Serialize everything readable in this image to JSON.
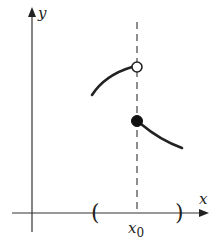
{
  "diagram": {
    "type": "piecewise function with jump discontinuity",
    "axes": {
      "x_label": "x",
      "y_label": "y"
    },
    "point_label": "x",
    "point_label_subscript": "0",
    "interval": {
      "left_bracket": "(",
      "right_bracket": ")"
    },
    "markers": [
      {
        "kind": "open-circle",
        "at": "x0",
        "position": "upper"
      },
      {
        "kind": "filled-circle",
        "at": "x0",
        "position": "lower"
      }
    ],
    "colors": {
      "stroke": "#222222",
      "background": "#ffffff",
      "dashed_line": "#444444"
    }
  }
}
